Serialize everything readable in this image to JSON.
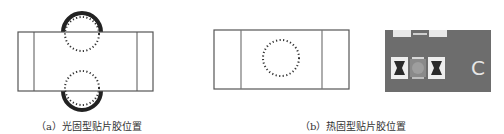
{
  "figure": {
    "panels": [
      {
        "id": "a",
        "caption": "（a）光固型贴片胶位置",
        "description": "Chip component with two semicircular glue dots at top and bottom edges (light-cure adhesive)"
      },
      {
        "id": "b",
        "caption": "（b）热固型贴片胶位置",
        "description": "Chip component with a single dotted glue circle at center (heat-cure adhesive)"
      }
    ],
    "photo": {
      "label": "C"
    },
    "colors": {
      "outline": "#555555",
      "glue_fill": "#222222",
      "dots": "#333333",
      "photo_bg": "#6f6f6f"
    }
  }
}
